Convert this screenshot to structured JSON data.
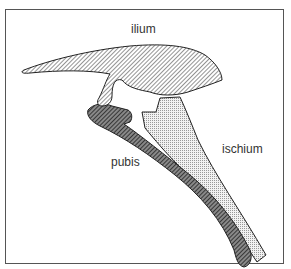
{
  "diagram": {
    "labels": {
      "ilium": "ilium",
      "pubis": "pubis",
      "ischium": "ischium"
    },
    "colors": {
      "outline": "#222222",
      "ilium_hatch": "#777777",
      "pubis_fill": "#555555",
      "ischium_dots": "#999999"
    }
  }
}
